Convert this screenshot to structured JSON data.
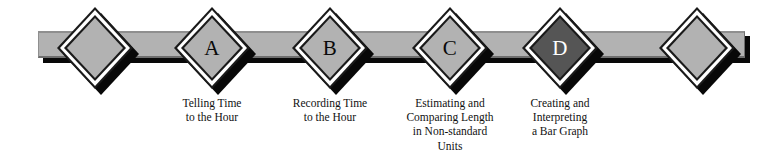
{
  "diagram": {
    "type": "milestone-timeline",
    "background_color": "#ffffff",
    "bar": {
      "fill_color": "#b2b2b2",
      "shadow_color": "#080808"
    },
    "diamond": {
      "fill_color": "#b2b2b2",
      "outline_color": "#ffffff",
      "border_color": "#1a1a1a",
      "shadow_color": "#080808",
      "current_fill_color": "#555555",
      "current_letter_color": "#ffffff",
      "letter_color": "#0a0a0a"
    },
    "nodes": [
      {
        "id": "start",
        "label": "",
        "x": 95,
        "state": "plain",
        "caption": []
      },
      {
        "id": "a",
        "label": "A",
        "x": 212,
        "state": "plain",
        "caption": [
          "Telling Time",
          "to the Hour"
        ]
      },
      {
        "id": "b",
        "label": "B",
        "x": 330,
        "state": "plain",
        "caption": [
          "Recording Time",
          "to the Hour"
        ]
      },
      {
        "id": "c",
        "label": "C",
        "x": 450,
        "state": "plain",
        "caption": [
          "Estimating and",
          "Comparing Length",
          "in Non-standard",
          "Units"
        ]
      },
      {
        "id": "d",
        "label": "D",
        "x": 560,
        "state": "current",
        "caption": [
          "Creating and",
          "Interpreting",
          "a Bar Graph"
        ]
      },
      {
        "id": "end",
        "label": "",
        "x": 697,
        "state": "plain",
        "caption": []
      }
    ]
  }
}
